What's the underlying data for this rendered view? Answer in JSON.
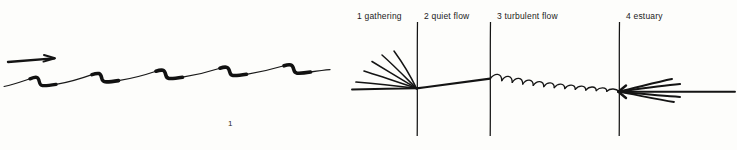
{
  "page": {
    "background_color": "#fdfdfb",
    "ink_color": "#121212",
    "width": 737,
    "height": 150
  },
  "figures": [
    {
      "id": "wave",
      "number": "1",
      "caption_number": "1",
      "kind": "hand-drawn-wave-profile",
      "description": "rising sawtooth wave profile with thickened descending steps and a flow arrow above",
      "arrow": {
        "name": "flow-direction-arrow",
        "direction": "right"
      },
      "step_count": 5
    },
    {
      "id": "river",
      "number": "2",
      "caption_number": "2",
      "kind": "hand-drawn-river-flow-zones",
      "zones": [
        {
          "index": "1",
          "label": "1 gathering",
          "name": "gathering"
        },
        {
          "index": "2",
          "label": "2 quiet flow",
          "name": "quiet flow"
        },
        {
          "index": "3",
          "label": "3 turbulent flow",
          "name": "turbulent flow"
        },
        {
          "index": "4",
          "label": "4 estuary",
          "name": "estuary"
        }
      ],
      "divider_count": 3,
      "turbulent_arc_count": 11,
      "gathering_tributary_count": 6,
      "estuary_branch_count": 5
    }
  ]
}
